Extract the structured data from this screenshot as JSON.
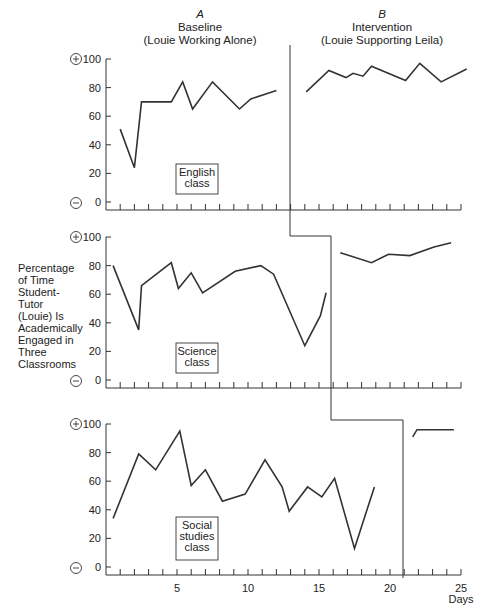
{
  "chart_data": {
    "type": "line",
    "title": "",
    "phases": [
      {
        "letter": "A",
        "name": "Baseline",
        "subtitle": "(Louie Working Alone)"
      },
      {
        "letter": "B",
        "name": "Intervention",
        "subtitle": "(Louie Supporting Leila)"
      }
    ],
    "ylabel_lines": [
      "Percentage",
      "of Time",
      "Student-",
      "Tutor",
      "(Louie) Is",
      "Academically",
      "Engaged in",
      "Three",
      "Classrooms"
    ],
    "xlabel": "Days",
    "x_ticks": [
      "5",
      "10",
      "15",
      "20",
      "25"
    ],
    "y_ticks": [
      "0",
      "20",
      "40",
      "60",
      "80",
      "100"
    ],
    "ylim": [
      0,
      100
    ],
    "xlim": [
      0,
      25
    ],
    "grid": false,
    "y_markers": {
      "top": "+",
      "bottom": "−"
    },
    "panels": [
      {
        "name": "English class",
        "label_lines": [
          "English",
          "class"
        ],
        "phase_change_after_day": 13,
        "series": [
          {
            "name": "Baseline",
            "x": [
              1,
              2,
              2.5,
              4.6,
              5.4,
              6.1,
              7.5,
              9.4,
              10.2,
              12
            ],
            "values": [
              51,
              24,
              70,
              70,
              84,
              65,
              84,
              65,
              72,
              78
            ]
          },
          {
            "name": "Intervention",
            "x": [
              14.1,
              15.7,
              16.9,
              17.4,
              18.1,
              18.7,
              21.1,
              22.1,
              23.6,
              25.4
            ],
            "values": [
              77,
              92,
              87,
              90,
              88,
              95,
              85,
              97,
              84,
              93
            ]
          }
        ]
      },
      {
        "name": "Science class",
        "label_lines": [
          "Science",
          "class"
        ],
        "phase_change_after_day": 15.8,
        "series": [
          {
            "name": "Baseline",
            "x": [
              0.5,
              2.3,
              2.5,
              4.6,
              5.1,
              6,
              6.8,
              9.1,
              10.9,
              11.8,
              14,
              15.1,
              15.5
            ],
            "values": [
              80,
              35,
              66,
              82,
              64,
              75,
              61,
              76,
              80,
              74,
              24,
              45,
              61
            ]
          },
          {
            "name": "Intervention",
            "x": [
              16.5,
              18.7,
              19.9,
              21.4,
              23.1,
              24.3
            ],
            "values": [
              89,
              82,
              88,
              87,
              93,
              96
            ]
          }
        ]
      },
      {
        "name": "Social studies class",
        "label_lines": [
          "Social",
          "studies",
          "class"
        ],
        "phase_change_after_day": 20.9,
        "series": [
          {
            "name": "Baseline",
            "x": [
              0.5,
              2.3,
              3.5,
              5.2,
              6,
              7,
              8.2,
              9.8,
              11.2,
              12.4,
              12.9,
              14.2,
              15.2,
              16.1,
              17.5,
              18.9
            ],
            "values": [
              34,
              79,
              68,
              95,
              57,
              68,
              46,
              51,
              75,
              56,
              39,
              56,
              49,
              62,
              13,
              56
            ]
          },
          {
            "name": "Intervention",
            "x": [
              21.6,
              21.9,
              24.5
            ],
            "values": [
              91,
              96,
              96
            ]
          }
        ]
      }
    ]
  }
}
